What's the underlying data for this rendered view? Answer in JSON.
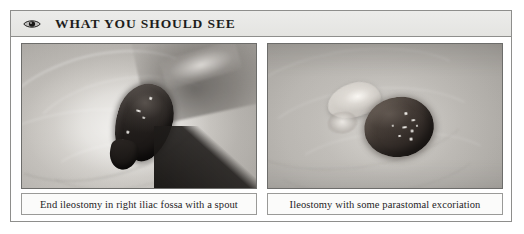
{
  "panel": {
    "header": {
      "icon": "eye-icon",
      "title": "WHAT YOU SHOULD SEE"
    },
    "figures": [
      {
        "id": "left",
        "photo_alt": "Clinical photograph of an end ileostomy in the right iliac fossa showing a dark protruding spout on pale abdominal skin",
        "caption": "End ileostomy in right iliac fossa with a spout"
      },
      {
        "id": "right",
        "photo_alt": "Clinical photograph of an ileostomy showing a round dark stoma with a pale excoriated area of skin beside it",
        "caption": "Ileostomy with some parastomal excoriation"
      }
    ]
  },
  "colors": {
    "page_background": "#ffffff",
    "panel_border": "#8e8e8c",
    "header_background": "#e8e8e6",
    "header_text": "#1d1d1b",
    "caption_background": "#fbfbfa",
    "caption_border": "#9a9a98",
    "caption_text": "#25231f",
    "photo_border": "#6d6d6b"
  }
}
